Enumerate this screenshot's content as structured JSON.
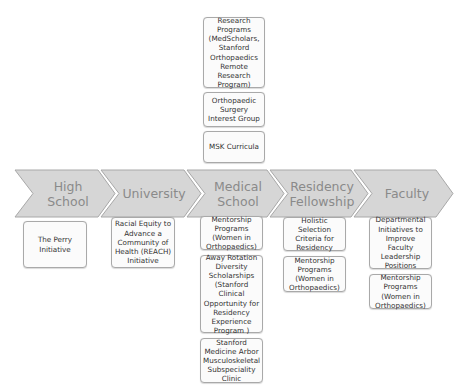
{
  "stages": [
    {
      "label": "High School"
    },
    {
      "label": "University"
    },
    {
      "label": "Medical School"
    },
    {
      "label": "Residency Fellowship"
    },
    {
      "label": "Faculty"
    }
  ],
  "above": {
    "medical_school": [
      {
        "text": "Research Programs (MedScholars, Stanford Orthopaedics Remote Research Program)"
      },
      {
        "text": "Orthopaedic Surgery Interest Group"
      },
      {
        "text": "MSK Curricula"
      }
    ]
  },
  "below": {
    "high_school": [
      {
        "text": "The Perry Initiative"
      }
    ],
    "university": [
      {
        "text": "Racial Equity to Advance a Community of Health (REACH) Initiative"
      }
    ],
    "medical_school": [
      {
        "text": "Mentorship Programs (Women in Orthopaedics)"
      },
      {
        "text": "Away Rotation Diversity Scholarships (Stanford Clinical Opportunity for Residency Experience Program )"
      },
      {
        "text": "Stanford Medicine Arbor Musculoskeletal Subspeciality Clinic"
      }
    ],
    "residency": [
      {
        "text": "Holistic Selection Criteria for Residency"
      },
      {
        "text": "Mentorship Programs (Women in Orthopaedics)"
      }
    ],
    "faculty": [
      {
        "text": "Departmental Initiatives to Improve Faculty Leadership Positions"
      },
      {
        "text": "Mentorship Programs (Women in Orthopaedics)"
      }
    ]
  },
  "colors": {
    "chevron_fill": "#d6d6d6",
    "chevron_stroke": "#a8a8a8",
    "chevron_text": "#8a8a8a",
    "box_border": "#a9a9a9",
    "box_text": "#333333"
  }
}
